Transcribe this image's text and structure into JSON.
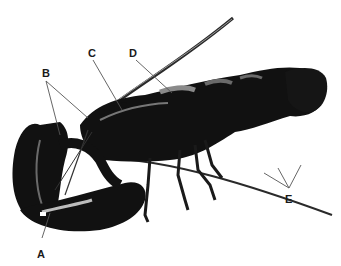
{
  "diagram": {
    "labels": [
      {
        "id": "A",
        "text": "A",
        "x": 37,
        "y": 248
      },
      {
        "id": "B",
        "text": "B",
        "x": 42,
        "y": 67
      },
      {
        "id": "C",
        "text": "C",
        "x": 88,
        "y": 47
      },
      {
        "id": "D",
        "text": "D",
        "x": 129,
        "y": 47
      },
      {
        "id": "E",
        "text": "E",
        "x": 285,
        "y": 193
      }
    ],
    "colors": {
      "body": "#111111",
      "highlight": "#8a8a8a",
      "pointer": "#555555",
      "background": "#ffffff"
    }
  }
}
